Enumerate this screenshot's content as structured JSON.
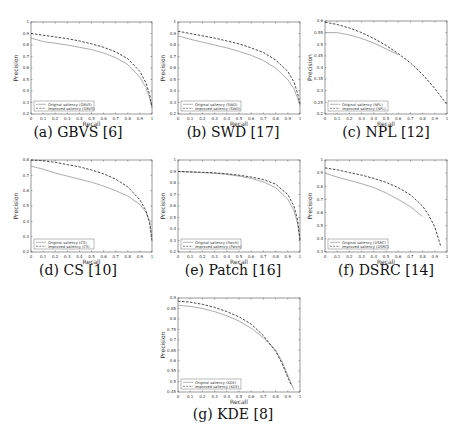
{
  "figure": {
    "panels": [
      {
        "id": "a",
        "caption": "(a) GBVS [6]",
        "left": 0,
        "top": 0,
        "plot": {
          "x": 31,
          "y": 22,
          "w": 121,
          "h": 92
        },
        "caption_top": 124
      },
      {
        "id": "b",
        "caption": "(b) SWD [17]",
        "left": 155,
        "top": 0,
        "plot": {
          "x": 23,
          "y": 22,
          "w": 122,
          "h": 92
        },
        "caption_top": 124
      },
      {
        "id": "c",
        "caption": "(c) NPL [12]",
        "left": 308,
        "top": 0,
        "plot": {
          "x": 17,
          "y": 21,
          "w": 122,
          "h": 93
        },
        "caption_top": 124
      },
      {
        "id": "d",
        "caption": "(d) CS [10]",
        "left": 0,
        "top": 145,
        "plot": {
          "x": 31,
          "y": 15,
          "w": 121,
          "h": 92
        },
        "caption_top": 117
      },
      {
        "id": "e",
        "caption": "(e) Patch [16]",
        "left": 155,
        "top": 145,
        "plot": {
          "x": 23,
          "y": 15,
          "w": 122,
          "h": 92
        },
        "caption_top": 117
      },
      {
        "id": "f",
        "caption": "(f) DSRC [14]",
        "left": 308,
        "top": 145,
        "plot": {
          "x": 17,
          "y": 15,
          "w": 122,
          "h": 92
        },
        "caption_top": 117
      },
      {
        "id": "g",
        "caption": "(g) KDE [8]",
        "left": 155,
        "top": 295,
        "plot": {
          "x": 23,
          "y": 3,
          "w": 122,
          "h": 94
        },
        "caption_top": 111
      }
    ]
  },
  "chart_data": [
    {
      "type": "line",
      "title": "(a) GBVS [6]",
      "xlabel": "Recall",
      "ylabel": "Precision",
      "xlim": [
        0,
        1
      ],
      "ylim": [
        0.2,
        1.0
      ],
      "xticks": [
        "0",
        "0.1",
        "0.2",
        "0.3",
        "0.4",
        "0.5",
        "0.6",
        "0.7",
        "0.8",
        "0.9",
        "1"
      ],
      "yticks": [
        "0.2",
        "0.3",
        "0.4",
        "0.5",
        "0.6",
        "0.7",
        "0.8",
        "0.9",
        "1"
      ],
      "legend_position": "lower left",
      "series": [
        {
          "name": "Original saliency (GBVS)",
          "style": "solid",
          "x": [
            0,
            0.1,
            0.2,
            0.3,
            0.4,
            0.5,
            0.6,
            0.7,
            0.8,
            0.9,
            0.95,
            0.98,
            1.0
          ],
          "y": [
            0.86,
            0.83,
            0.815,
            0.8,
            0.78,
            0.76,
            0.73,
            0.69,
            0.63,
            0.52,
            0.43,
            0.34,
            0.25
          ]
        },
        {
          "name": "Improved saliency (GBVS)",
          "style": "dashed",
          "x": [
            0,
            0.1,
            0.2,
            0.3,
            0.4,
            0.5,
            0.6,
            0.7,
            0.8,
            0.9,
            0.95,
            0.98,
            1.0
          ],
          "y": [
            0.9,
            0.885,
            0.87,
            0.855,
            0.835,
            0.81,
            0.78,
            0.74,
            0.68,
            0.57,
            0.47,
            0.37,
            0.26
          ]
        }
      ]
    },
    {
      "type": "line",
      "title": "(b) SWD [17]",
      "xlabel": "Recall",
      "ylabel": "Precision",
      "xlim": [
        0,
        1
      ],
      "ylim": [
        0.2,
        1.0
      ],
      "xticks": [
        "0",
        "0.1",
        "0.2",
        "0.3",
        "0.4",
        "0.5",
        "0.6",
        "0.7",
        "0.8",
        "0.9",
        "1"
      ],
      "yticks": [
        "0.2",
        "0.3",
        "0.4",
        "0.5",
        "0.6",
        "0.7",
        "0.8",
        "0.9",
        "1"
      ],
      "legend_position": "lower left",
      "series": [
        {
          "name": "Original saliency (SWD)",
          "style": "solid",
          "x": [
            0,
            0.1,
            0.2,
            0.3,
            0.4,
            0.5,
            0.6,
            0.7,
            0.8,
            0.9,
            0.95,
            0.98,
            1.0
          ],
          "y": [
            0.88,
            0.85,
            0.825,
            0.8,
            0.775,
            0.745,
            0.71,
            0.665,
            0.6,
            0.5,
            0.42,
            0.34,
            0.27
          ]
        },
        {
          "name": "Improved saliency (SWD)",
          "style": "dashed",
          "x": [
            0,
            0.1,
            0.2,
            0.3,
            0.4,
            0.5,
            0.6,
            0.7,
            0.8,
            0.9,
            0.95,
            0.98,
            1.0
          ],
          "y": [
            0.92,
            0.9,
            0.88,
            0.86,
            0.835,
            0.81,
            0.775,
            0.735,
            0.67,
            0.57,
            0.48,
            0.38,
            0.29
          ]
        }
      ]
    },
    {
      "type": "line",
      "title": "(c) NPL [12]",
      "xlabel": "Recall",
      "ylabel": "Precision",
      "xlim": [
        0,
        1
      ],
      "ylim": [
        0.2,
        0.6
      ],
      "xticks": [
        "0",
        "0.1",
        "0.2",
        "0.3",
        "0.4",
        "0.5",
        "0.6",
        "0.7",
        "0.8",
        "0.9",
        "1"
      ],
      "yticks": [
        "0.2",
        "0.25",
        "0.3",
        "0.35",
        "0.4",
        "0.45",
        "0.5",
        "0.55",
        "0.6"
      ],
      "legend_position": "lower left",
      "series": [
        {
          "name": "Original saliency (NPL)",
          "style": "solid",
          "x": [
            0,
            0.1,
            0.2,
            0.3,
            0.4,
            0.5,
            0.6
          ],
          "y": [
            0.55,
            0.55,
            0.54,
            0.525,
            0.505,
            0.48,
            0.455
          ]
        },
        {
          "name": "Improved saliency (NPL)",
          "style": "dashed",
          "x": [
            0,
            0.1,
            0.2,
            0.3,
            0.4,
            0.5,
            0.6,
            0.7,
            0.8,
            0.9,
            1.0
          ],
          "y": [
            0.595,
            0.585,
            0.57,
            0.55,
            0.525,
            0.495,
            0.46,
            0.42,
            0.37,
            0.31,
            0.24
          ]
        }
      ]
    },
    {
      "type": "line",
      "title": "(d) CS [10]",
      "xlabel": "Recall",
      "ylabel": "Precision",
      "xlim": [
        0,
        1
      ],
      "ylim": [
        0.2,
        0.8
      ],
      "xticks": [
        "0",
        "0.1",
        "0.2",
        "0.3",
        "0.4",
        "0.5",
        "0.6",
        "0.7",
        "0.8",
        "0.9",
        "1"
      ],
      "yticks": [
        "0.2",
        "0.3",
        "0.4",
        "0.5",
        "0.6",
        "0.7",
        "0.8"
      ],
      "legend_position": "lower left",
      "series": [
        {
          "name": "Original saliency (CS)",
          "style": "solid",
          "x": [
            0,
            0.1,
            0.2,
            0.3,
            0.4,
            0.5,
            0.6,
            0.7,
            0.8,
            0.9,
            0.95,
            0.98,
            1.0
          ],
          "y": [
            0.76,
            0.74,
            0.715,
            0.695,
            0.675,
            0.655,
            0.63,
            0.6,
            0.565,
            0.51,
            0.46,
            0.4,
            0.3
          ]
        },
        {
          "name": "Improved saliency (CS)",
          "style": "dashed",
          "x": [
            0,
            0.1,
            0.2,
            0.3,
            0.4,
            0.5,
            0.6,
            0.7,
            0.8,
            0.9,
            0.95,
            0.98,
            1.0
          ],
          "y": [
            0.8,
            0.795,
            0.785,
            0.77,
            0.755,
            0.735,
            0.71,
            0.675,
            0.625,
            0.54,
            0.47,
            0.39,
            0.27
          ]
        }
      ]
    },
    {
      "type": "line",
      "title": "(e) Patch [16]",
      "xlabel": "Recall",
      "ylabel": "Precision",
      "xlim": [
        0,
        1
      ],
      "ylim": [
        0.2,
        1.0
      ],
      "xticks": [
        "0",
        "0.1",
        "0.2",
        "0.3",
        "0.4",
        "0.5",
        "0.6",
        "0.7",
        "0.8",
        "0.9",
        "1"
      ],
      "yticks": [
        "0.2",
        "0.3",
        "0.4",
        "0.5",
        "0.6",
        "0.7",
        "0.8",
        "0.9",
        "1"
      ],
      "legend_position": "lower left",
      "series": [
        {
          "name": "Original saliency (Patch)",
          "style": "solid",
          "x": [
            0,
            0.1,
            0.2,
            0.3,
            0.4,
            0.5,
            0.6,
            0.7,
            0.8,
            0.9,
            0.95,
            0.98,
            1.0
          ],
          "y": [
            0.9,
            0.895,
            0.89,
            0.885,
            0.875,
            0.86,
            0.84,
            0.81,
            0.76,
            0.66,
            0.56,
            0.45,
            0.3
          ]
        },
        {
          "name": "Improved saliency (Patch)",
          "style": "dashed",
          "x": [
            0,
            0.1,
            0.2,
            0.3,
            0.4,
            0.5,
            0.6,
            0.7,
            0.8,
            0.9,
            0.95,
            0.98,
            1.0
          ],
          "y": [
            0.9,
            0.897,
            0.893,
            0.888,
            0.88,
            0.868,
            0.852,
            0.83,
            0.79,
            0.7,
            0.6,
            0.48,
            0.3
          ]
        }
      ]
    },
    {
      "type": "line",
      "title": "(f) DSRC [14]",
      "xlabel": "Recall",
      "ylabel": "Precision",
      "xlim": [
        0,
        1
      ],
      "ylim": [
        0.3,
        1.0
      ],
      "xticks": [
        "0",
        "0.1",
        "0.2",
        "0.3",
        "0.4",
        "0.5",
        "0.6",
        "0.7",
        "0.8",
        "0.9",
        "1"
      ],
      "yticks": [
        "0.3",
        "0.4",
        "0.5",
        "0.6",
        "0.7",
        "0.8",
        "0.9",
        "1"
      ],
      "legend_position": "lower left",
      "series": [
        {
          "name": "Original saliency (DSRC)",
          "style": "solid",
          "x": [
            0,
            0.1,
            0.2,
            0.3,
            0.4,
            0.5,
            0.6,
            0.7,
            0.8
          ],
          "y": [
            0.9,
            0.87,
            0.845,
            0.82,
            0.79,
            0.75,
            0.7,
            0.645,
            0.57
          ]
        },
        {
          "name": "Improved saliency (DSRC)",
          "style": "dashed",
          "x": [
            0,
            0.1,
            0.2,
            0.3,
            0.4,
            0.5,
            0.6,
            0.7,
            0.8,
            0.85,
            0.9,
            0.95
          ],
          "y": [
            0.94,
            0.925,
            0.905,
            0.885,
            0.86,
            0.83,
            0.79,
            0.735,
            0.65,
            0.58,
            0.49,
            0.34
          ]
        }
      ]
    },
    {
      "type": "line",
      "title": "(g) KDE [8]",
      "xlabel": "Recall",
      "ylabel": "Precision",
      "xlim": [
        0,
        1
      ],
      "ylim": [
        0.45,
        0.9
      ],
      "xticks": [
        "0",
        "0.1",
        "0.2",
        "0.3",
        "0.4",
        "0.5",
        "0.6",
        "0.7",
        "0.8",
        "0.9",
        "1"
      ],
      "yticks": [
        "0.45",
        "0.5",
        "0.55",
        "0.6",
        "0.65",
        "0.7",
        "0.75",
        "0.8",
        "0.85",
        "0.9"
      ],
      "legend_position": "lower left",
      "series": [
        {
          "name": "Original saliency (KDE)",
          "style": "solid",
          "x": [
            0,
            0.1,
            0.2,
            0.3,
            0.4,
            0.5,
            0.6,
            0.7,
            0.8,
            0.85,
            0.9,
            0.95
          ],
          "y": [
            0.865,
            0.86,
            0.85,
            0.835,
            0.815,
            0.79,
            0.755,
            0.71,
            0.65,
            0.6,
            0.53,
            0.46
          ]
        },
        {
          "name": "Improved saliency (KDE)",
          "style": "dashed",
          "x": [
            0,
            0.1,
            0.2,
            0.3,
            0.4,
            0.5,
            0.6,
            0.7,
            0.8,
            0.85,
            0.9,
            0.93
          ],
          "y": [
            0.885,
            0.88,
            0.87,
            0.855,
            0.835,
            0.81,
            0.775,
            0.72,
            0.645,
            0.59,
            0.52,
            0.48
          ]
        }
      ]
    }
  ]
}
